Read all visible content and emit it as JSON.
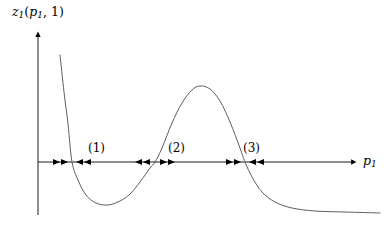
{
  "figure": {
    "type": "phase-line-diagram",
    "background_color": "#ffffff",
    "curve_color": "#555555",
    "axis_color": "#000000",
    "text_color": "#000000"
  },
  "axes": {
    "y_label": "z1(p1, 1)",
    "y_label_base": "z",
    "y_label_sub": "1",
    "y_label_args_open": "(",
    "y_label_arg1": "p",
    "y_label_arg1_sub": "1",
    "y_label_sep": ", 1",
    "y_label_args_close": ")",
    "x_label": "p1",
    "x_label_base": "p",
    "x_label_sub": "1",
    "x_axis_y": 162,
    "y_axis_x": 38,
    "x_axis_start": 38,
    "x_axis_end": 358,
    "y_axis_top": 32,
    "y_axis_bottom": 215
  },
  "regions": [
    {
      "label": "(1)",
      "x": 88,
      "y": 142
    },
    {
      "label": "(2)",
      "x": 168,
      "y": 142
    },
    {
      "label": "(3)",
      "x": 243,
      "y": 142
    }
  ],
  "equilibria": [
    {
      "index": 1,
      "x": 72,
      "stability": "stable",
      "left_flow": "right",
      "right_flow": "left"
    },
    {
      "index": 2,
      "x": 155,
      "stability": "unstable",
      "left_flow": "left",
      "right_flow": "right"
    },
    {
      "index": 3,
      "x": 245,
      "stability": "stable",
      "left_flow": "right",
      "right_flow": "left"
    }
  ],
  "flow_arrows": [
    {
      "x": 56,
      "direction": "right"
    },
    {
      "x": 64,
      "direction": "right"
    },
    {
      "x": 80,
      "direction": "left"
    },
    {
      "x": 88,
      "direction": "left"
    },
    {
      "x": 139,
      "direction": "left"
    },
    {
      "x": 147,
      "direction": "left"
    },
    {
      "x": 163,
      "direction": "right"
    },
    {
      "x": 171,
      "direction": "right"
    },
    {
      "x": 229,
      "direction": "right"
    },
    {
      "x": 237,
      "direction": "right"
    },
    {
      "x": 253,
      "direction": "left"
    },
    {
      "x": 261,
      "direction": "left"
    }
  ],
  "chart_data": {
    "type": "line",
    "title": "",
    "xlabel": "p1",
    "ylabel": "z1(p1, 1)",
    "grid": false,
    "legend": "none",
    "zero_crossings": [
      72,
      155,
      245
    ],
    "extrema": [
      {
        "kind": "minimum",
        "x": 108,
        "y": 205
      },
      {
        "kind": "maximum",
        "x": 200,
        "y": 86
      }
    ],
    "curve_points": [
      [
        60,
        55
      ],
      [
        64,
        92
      ],
      [
        68,
        124
      ],
      [
        72,
        162
      ],
      [
        78,
        180
      ],
      [
        86,
        195
      ],
      [
        96,
        203
      ],
      [
        108,
        205
      ],
      [
        120,
        201
      ],
      [
        130,
        194
      ],
      [
        140,
        182
      ],
      [
        150,
        168
      ],
      [
        155,
        162
      ],
      [
        162,
        148
      ],
      [
        172,
        123
      ],
      [
        182,
        103
      ],
      [
        192,
        90
      ],
      [
        200,
        86
      ],
      [
        210,
        89
      ],
      [
        220,
        101
      ],
      [
        230,
        122
      ],
      [
        240,
        148
      ],
      [
        245,
        162
      ],
      [
        252,
        177
      ],
      [
        262,
        192
      ],
      [
        275,
        202
      ],
      [
        292,
        208
      ],
      [
        315,
        211
      ],
      [
        345,
        212
      ],
      [
        380,
        213
      ]
    ]
  }
}
